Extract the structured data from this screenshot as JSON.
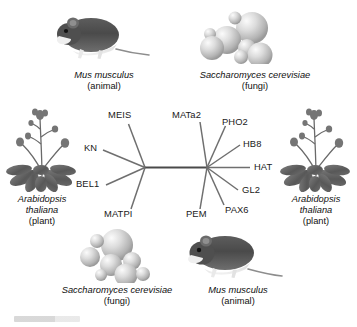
{
  "figure": {
    "type": "unrooted-phylogenetic-tree"
  },
  "genes": {
    "left_node": [
      {
        "id": "MEIS",
        "label": "MEIS"
      },
      {
        "id": "KN",
        "label": "KN"
      },
      {
        "id": "BEL1",
        "label": "BEL1"
      },
      {
        "id": "MATPI",
        "label": "MATPI"
      }
    ],
    "right_node": [
      {
        "id": "MATa2",
        "label": "MATa2"
      },
      {
        "id": "PHO2",
        "label": "PHO2"
      },
      {
        "id": "HB8",
        "label": "HB8"
      },
      {
        "id": "HAT",
        "label": "HAT"
      },
      {
        "id": "GL2",
        "label": "GL2"
      },
      {
        "id": "PAX6",
        "label": "PAX6"
      },
      {
        "id": "PEM",
        "label": "PEM"
      }
    ]
  },
  "organisms": [
    {
      "id": "mouse-top",
      "icon": "mouse-illustration",
      "species": "Mus musculus",
      "group": "(animal)"
    },
    {
      "id": "yeast-top",
      "icon": "yeast-illustration",
      "species": "Saccharomyces cerevisiae",
      "group": "(fungi)"
    },
    {
      "id": "plant-left",
      "icon": "arabidopsis-illustration",
      "species_line1": "Arabidopsis",
      "species_line2": "thaliana",
      "group": "(plant)"
    },
    {
      "id": "plant-right",
      "icon": "arabidopsis-illustration",
      "species_line1": "Arabidopsis",
      "species_line2": "thaliana",
      "group": "(plant)"
    },
    {
      "id": "yeast-bottom",
      "icon": "yeast-illustration",
      "species": "Saccharomyces cerevisiae",
      "group": "(fungi)"
    },
    {
      "id": "mouse-bottom",
      "icon": "mouse-illustration",
      "species": "Mus musculus",
      "group": "(animal)"
    }
  ],
  "colors": {
    "branch": "#6f6f6f",
    "trunk": "#4a4a4a",
    "text": "#1a1a1a",
    "background": "#ffffff"
  }
}
